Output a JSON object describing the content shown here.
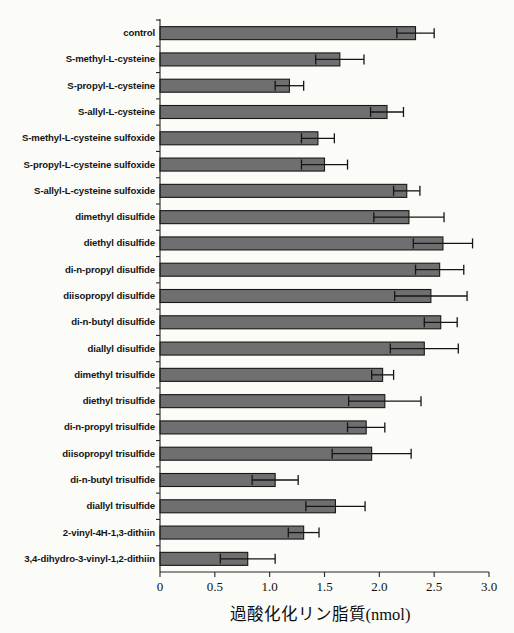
{
  "chart_data": {
    "type": "bar",
    "orientation": "horizontal",
    "title": "",
    "xlabel": "過酸化化リン脂質(nmol)",
    "ylabel": "",
    "xlim": [
      0,
      3.0
    ],
    "xticks": [
      "0",
      "0.5",
      "1.0",
      "1.5",
      "2.0",
      "2.5",
      "3.0"
    ],
    "xtick_values": [
      0,
      0.5,
      1.0,
      1.5,
      2.0,
      2.5,
      3.0
    ],
    "grid": false,
    "legend": "none",
    "categories": [
      "control",
      "S-methyl-L-cysteine",
      "S-propyl-L-cysteine",
      "S-allyl-L-cysteine",
      "S-methyl-L-cysteine sulfoxide",
      "S-propyl-L-cysteine sulfoxide",
      "S-allyl-L-cysteine sulfoxide",
      "dimethyl disulfide",
      "diethyl disulfide",
      "di-n-propyl disulfide",
      "diisopropyl disulfide",
      "di-n-butyl disulfide",
      "diallyl disulfide",
      "dimethyl trisulfide",
      "diethyl trisulfide",
      "di-n-propyl trisulfide",
      "diisopropyl trisulfide",
      "di-n-butyl trisulfide",
      "diallyl trisulfide",
      "2-vinyl-4H-1,3-dithiin",
      "3,4-dihydro-3-vinyl-1,2-dithiin"
    ],
    "values": [
      2.33,
      1.64,
      1.18,
      2.07,
      1.44,
      1.5,
      2.25,
      2.27,
      2.58,
      2.55,
      2.47,
      2.56,
      2.41,
      2.03,
      2.05,
      1.88,
      1.93,
      1.05,
      1.6,
      1.31,
      0.8
    ],
    "errors": [
      0.17,
      0.22,
      0.13,
      0.15,
      0.15,
      0.21,
      0.12,
      0.32,
      0.27,
      0.22,
      0.33,
      0.15,
      0.31,
      0.1,
      0.33,
      0.17,
      0.36,
      0.21,
      0.27,
      0.14,
      0.25
    ]
  },
  "style": {
    "bar_fill": "#6f6f6f",
    "bar_stroke": "#171717",
    "axis_color": "#262626",
    "error_color": "#151515",
    "background": "#fdfdfb"
  }
}
